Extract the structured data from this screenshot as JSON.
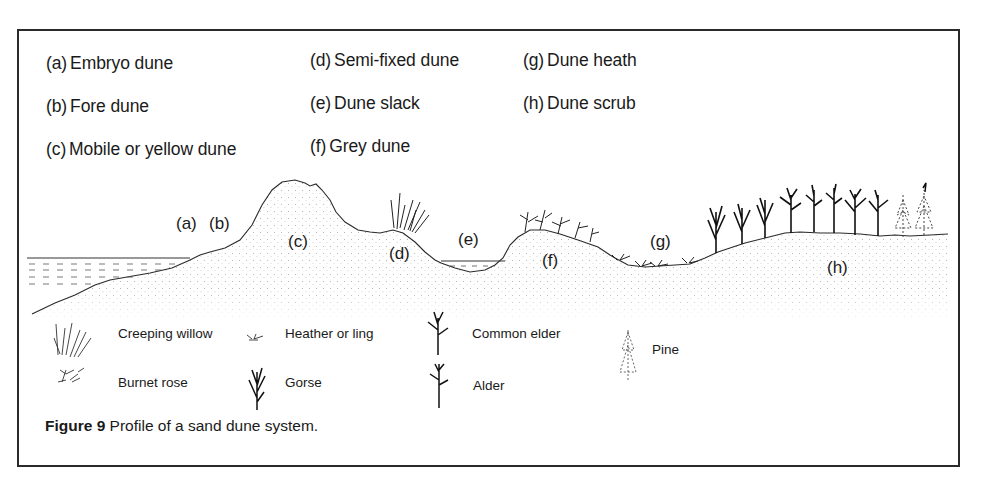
{
  "figure": {
    "caption_number": "Figure 9",
    "caption_text": " Profile of a sand dune system."
  },
  "key": [
    {
      "code": "(a)",
      "label": "Embryo dune"
    },
    {
      "code": "(b)",
      "label": "Fore dune"
    },
    {
      "code": "(c)",
      "label": "Mobile or yellow dune"
    },
    {
      "code": "(d)",
      "label": "Semi-fixed dune"
    },
    {
      "code": "(e)",
      "label": "Dune slack"
    },
    {
      "code": "(f)",
      "label": "Grey dune"
    },
    {
      "code": "(g)",
      "label": "Dune heath"
    },
    {
      "code": "(h)",
      "label": "Dune scrub"
    }
  ],
  "profile_labels": [
    "(a)",
    "(b)",
    "(c)",
    "(d)",
    "(e)",
    "(f)",
    "(g)",
    "(h)"
  ],
  "legend": [
    {
      "icon": "creeping-willow-icon",
      "label": "Creeping willow"
    },
    {
      "icon": "burnet-rose-icon",
      "label": "Burnet rose"
    },
    {
      "icon": "heather-icon",
      "label": "Heather or ling"
    },
    {
      "icon": "gorse-icon",
      "label": "Gorse"
    },
    {
      "icon": "common-elder-icon",
      "label": "Common elder"
    },
    {
      "icon": "alder-icon",
      "label": "Alder"
    },
    {
      "icon": "pine-icon",
      "label": "Pine"
    }
  ],
  "colors": {
    "ink": "#1a1a1a",
    "frame": "#2a2a2a",
    "sand_stipple": "#b8b8b8",
    "background": "#ffffff"
  }
}
